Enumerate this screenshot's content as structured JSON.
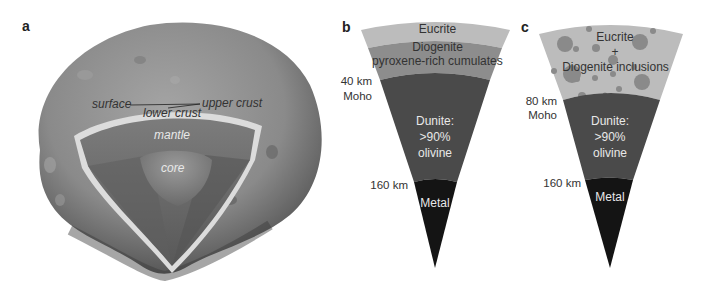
{
  "panels": {
    "a": {
      "label": "a",
      "title": "Vesta cutaway",
      "labels": {
        "surface": "surface",
        "upper_crust": "upper crust",
        "lower_crust": "lower crust",
        "mantle": "mantle",
        "core": "core"
      }
    },
    "b": {
      "label": "b",
      "layers": {
        "eucrite": "Eucrite",
        "diogenite": "Diogenite",
        "cumulates": "pyroxene-rich cumulates",
        "dunite_1": "Dunite:",
        "dunite_2": ">90%",
        "dunite_3": "olivine",
        "metal": "Metal"
      },
      "depths": {
        "moho_depth": "40 km",
        "moho_label": "Moho",
        "core_depth": "160 km"
      }
    },
    "c": {
      "label": "c",
      "layers": {
        "crust_1": "Eucrite",
        "crust_2": "+",
        "crust_3": "Diogenite inclusions",
        "dunite_1": "Dunite:",
        "dunite_2": ">90%",
        "dunite_3": "olivine",
        "metal": "Metal"
      },
      "depths": {
        "moho_depth": "80 km",
        "moho_label": "Moho",
        "core_depth": "160 km"
      }
    }
  },
  "colors": {
    "eucrite": "#b9b9b9",
    "diogenite": "#8c8c8c",
    "dunite": "#4a4a4a",
    "metal": "#141414",
    "inclusion": "#8a8a8a",
    "asteroid": "#8e8e8e",
    "mantle": "#6a6a6a",
    "core": "#8a8a8a"
  }
}
